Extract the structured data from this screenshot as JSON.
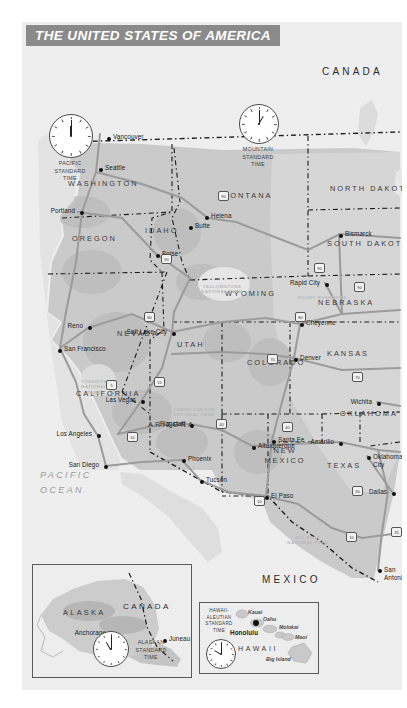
{
  "title": "THE UNITED STATES OF AMERICA",
  "countries": [
    {
      "name": "CANADA",
      "x": 300,
      "y": 45
    },
    {
      "name": "MEXICO",
      "x": 240,
      "y": 553
    }
  ],
  "ocean_label": "PACIFIC\nOCEAN",
  "states": [
    {
      "name": "WASHINGTON",
      "x": 46,
      "y": 158,
      "w": 78
    },
    {
      "name": "OREGON",
      "x": 50,
      "y": 213,
      "w": 62
    },
    {
      "name": "IDAHO",
      "x": 123,
      "y": 205,
      "w": 42
    },
    {
      "name": "MONTANA",
      "x": 200,
      "y": 170,
      "w": 62
    },
    {
      "name": "NORTH DAKOTA",
      "x": 308,
      "y": 163,
      "w": 62
    },
    {
      "name": "SOUTH DAKOTA",
      "x": 305,
      "y": 218,
      "w": 62
    },
    {
      "name": "WYOMING",
      "x": 203,
      "y": 268,
      "w": 60
    },
    {
      "name": "NEBRASKA",
      "x": 296,
      "y": 277,
      "w": 60
    },
    {
      "name": "NEVADA",
      "x": 95,
      "y": 308,
      "w": 50
    },
    {
      "name": "UTAH",
      "x": 155,
      "y": 319,
      "w": 32
    },
    {
      "name": "COLORADO",
      "x": 225,
      "y": 337,
      "w": 56
    },
    {
      "name": "KANSAS",
      "x": 305,
      "y": 328,
      "w": 50
    },
    {
      "name": "CALIFORNIA",
      "x": 54,
      "y": 368,
      "w": 68
    },
    {
      "name": "ARIZONA",
      "x": 126,
      "y": 399,
      "w": 48
    },
    {
      "name": "OKLAHOMA",
      "x": 318,
      "y": 388,
      "w": 52
    },
    {
      "name": "NEW MEXICO",
      "x": 242,
      "y": 424,
      "w": 42,
      "two": true
    },
    {
      "name": "TEXAS",
      "x": 305,
      "y": 440,
      "w": 42
    }
  ],
  "cities": [
    {
      "name": "Vancouver",
      "x": 85,
      "y": 115,
      "lx": -1,
      "side": "right"
    },
    {
      "name": "Seattle",
      "x": 77,
      "y": 146,
      "side": "right"
    },
    {
      "name": "Portland",
      "x": 58,
      "y": 189,
      "side": "left"
    },
    {
      "name": "Butte",
      "x": 167,
      "y": 204,
      "side": "right"
    },
    {
      "name": "Helena",
      "x": 183,
      "y": 194,
      "side": "right"
    },
    {
      "name": "Boise",
      "x": 134,
      "y": 232,
      "side": "right"
    },
    {
      "name": "Bismarck",
      "x": 317,
      "y": 212,
      "side": "right"
    },
    {
      "name": "Rapid City",
      "x": 303,
      "y": 261,
      "side": "left"
    },
    {
      "name": "Cheyenne",
      "x": 278,
      "y": 301,
      "side": "right"
    },
    {
      "name": "Denver",
      "x": 272,
      "y": 336,
      "side": "right"
    },
    {
      "name": "Reno",
      "x": 66,
      "y": 304,
      "side": "left"
    },
    {
      "name": "San Francisco",
      "x": 36,
      "y": 327,
      "side": "right"
    },
    {
      "name": "Salt Lake City",
      "x": 150,
      "y": 310,
      "side": "left"
    },
    {
      "name": "Las Vegas",
      "x": 119,
      "y": 378,
      "side": "left"
    },
    {
      "name": "Los Angeles",
      "x": 75,
      "y": 412,
      "side": "left"
    },
    {
      "name": "San Diego",
      "x": 82,
      "y": 443,
      "side": "left"
    },
    {
      "name": "Flagstaff",
      "x": 168,
      "y": 402,
      "side": "left"
    },
    {
      "name": "Phoenix",
      "x": 160,
      "y": 437,
      "side": "right"
    },
    {
      "name": "Tucson",
      "x": 178,
      "y": 458,
      "side": "right"
    },
    {
      "name": "Albuquerque",
      "x": 230,
      "y": 424,
      "side": "right"
    },
    {
      "name": "Santa Fe",
      "x": 250,
      "y": 418,
      "side": "right"
    },
    {
      "name": "El Paso",
      "x": 243,
      "y": 474,
      "side": "right"
    },
    {
      "name": "Amarillo",
      "x": 317,
      "y": 420,
      "side": "left"
    },
    {
      "name": "Wichita",
      "x": 355,
      "y": 380,
      "side": "left"
    },
    {
      "name": "Oklahoma City",
      "x": 345,
      "y": 434,
      "side": "right",
      "two": true
    },
    {
      "name": "Dallas",
      "x": 370,
      "y": 470,
      "side": "left"
    },
    {
      "name": "San Antonio",
      "x": 356,
      "y": 547,
      "side": "right",
      "two": true
    }
  ],
  "parks": [
    {
      "name": "YELLOWSTONE\nNATIONAL PARK",
      "x": 200,
      "y": 262
    },
    {
      "name": "YOSEMITE\nNATIONAL\nPARK",
      "x": 72,
      "y": 357
    },
    {
      "name": "GRAND CANYON\nNATIONAL PARK",
      "x": 172,
      "y": 385
    },
    {
      "name": "MOUNT RUSHMORE",
      "x": 300,
      "y": 273
    },
    {
      "name": "BIG BEND\nNATIONAL PARK",
      "x": 286,
      "y": 513
    }
  ],
  "time_zones": [
    {
      "label": "PACIFIC\nSTANDARD\nTIME",
      "x": 27,
      "y": 92,
      "r": 21,
      "hour": 12,
      "minute": 0
    },
    {
      "label": "MOUNTAIN\nSTANDARD\nTIME",
      "x": 217,
      "y": 82,
      "r": 19,
      "hour": 1,
      "minute": 0
    }
  ],
  "insets": {
    "alaska": {
      "region": "ALASKA",
      "neighbor": "CANADA",
      "cities": [
        {
          "name": "Anchorage",
          "x": 76,
          "y": 68
        },
        {
          "name": "Juneau",
          "x": 130,
          "y": 74
        }
      ],
      "tz_label": "ALASKAN\nSTANDARD\nTIME",
      "clock": {
        "hour": 11,
        "minute": 0
      }
    },
    "hawaii": {
      "region": "HAWAII",
      "tz_label": "HAWAII-\nALEUTIAN\nSTANDARD\nTIME",
      "clock": {
        "hour": 10,
        "minute": 0
      },
      "islands": [
        {
          "name": "Kauai",
          "x": 48,
          "y": 7
        },
        {
          "name": "Oahu",
          "x": 63,
          "y": 14
        },
        {
          "name": "Molokai",
          "x": 79,
          "y": 22
        },
        {
          "name": "Maui",
          "x": 95,
          "y": 32
        },
        {
          "name": "Big Island",
          "x": 66,
          "y": 54
        }
      ],
      "capital": {
        "name": "Honolulu",
        "x": 38,
        "y": 30
      }
    }
  },
  "shields": [
    {
      "num": "90",
      "x": 196,
      "y": 169
    },
    {
      "num": "90",
      "x": 139,
      "y": 232
    },
    {
      "num": "90",
      "x": 292,
      "y": 241
    },
    {
      "num": "90",
      "x": 332,
      "y": 260
    },
    {
      "num": "80",
      "x": 122,
      "y": 290
    },
    {
      "num": "80",
      "x": 273,
      "y": 290
    },
    {
      "num": "15",
      "x": 132,
      "y": 355
    },
    {
      "num": "70",
      "x": 245,
      "y": 332
    },
    {
      "num": "70",
      "x": 330,
      "y": 350
    },
    {
      "num": "10",
      "x": 105,
      "y": 410
    },
    {
      "num": "40",
      "x": 194,
      "y": 397
    },
    {
      "num": "40",
      "x": 260,
      "y": 400
    },
    {
      "num": "10",
      "x": 232,
      "y": 474
    },
    {
      "num": "35",
      "x": 330,
      "y": 464
    },
    {
      "num": "35",
      "x": 369,
      "y": 505
    },
    {
      "num": "10",
      "x": 324,
      "y": 510
    },
    {
      "num": "5",
      "x": 84,
      "y": 358
    }
  ],
  "colors": {
    "banner_bg": "#8a8a8a",
    "banner_text": "#ffffff",
    "land": "#c9c9c9",
    "ocean": "#eeeeee",
    "road": "#9b9b9b",
    "border": "#1c1c1c"
  }
}
